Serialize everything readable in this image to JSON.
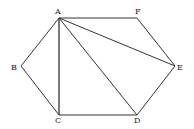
{
  "diagram": {
    "type": "hexagon-with-diagonals",
    "vertices": {
      "A": {
        "label": "A",
        "x": 59,
        "y": 18
      },
      "F": {
        "label": "F",
        "x": 137,
        "y": 18
      },
      "E": {
        "label": "E",
        "x": 175,
        "y": 66
      },
      "D": {
        "label": "D",
        "x": 137,
        "y": 115
      },
      "C": {
        "label": "C",
        "x": 59,
        "y": 115
      },
      "B": {
        "label": "B",
        "x": 21,
        "y": 66
      }
    },
    "edges": [
      [
        "A",
        "F"
      ],
      [
        "F",
        "E"
      ],
      [
        "E",
        "D"
      ],
      [
        "D",
        "C"
      ],
      [
        "C",
        "B"
      ],
      [
        "B",
        "A"
      ]
    ],
    "diagonals": [
      [
        "A",
        "C"
      ],
      [
        "A",
        "D"
      ],
      [
        "A",
        "E"
      ]
    ],
    "stroke_color": "#333333"
  }
}
